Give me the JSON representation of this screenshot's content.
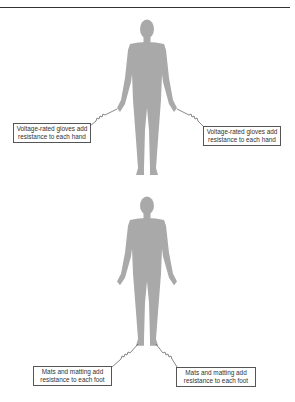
{
  "header": {
    "caption": ""
  },
  "colors": {
    "body": "#a9a9a9",
    "line": "#555555",
    "rule": "#333333"
  },
  "figures": [
    {
      "id": "top-figure",
      "topic": "hands",
      "labels": [
        {
          "side": "left",
          "line1": "Voltage-rated gloves add",
          "line2": "resistance to each hand"
        },
        {
          "side": "right",
          "line1": "Voltage-rated gloves add",
          "line2": "resistance to each hand"
        }
      ]
    },
    {
      "id": "bottom-figure",
      "topic": "feet",
      "labels": [
        {
          "side": "left",
          "line1": "Mats and matting add",
          "line2": "resistance to each foot"
        },
        {
          "side": "right",
          "line1": "Mats and matting add",
          "line2": "resistance to each foot"
        }
      ]
    }
  ],
  "icons": {
    "resistor": "resistor-zigzag-icon",
    "body": "human-silhouette-icon"
  }
}
